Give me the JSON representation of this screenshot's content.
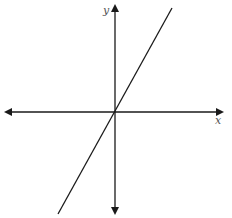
{
  "diagram": {
    "type": "coordinate-plane",
    "axes": {
      "x_label": "x",
      "y_label": "y",
      "color": "#1a1a1a",
      "origin_px": [
        115,
        112
      ]
    },
    "line": {
      "description": "straight line through origin with positive slope",
      "color": "#1a1a1a",
      "from_px": [
        58,
        214
      ],
      "to_px": [
        172,
        8
      ]
    }
  }
}
